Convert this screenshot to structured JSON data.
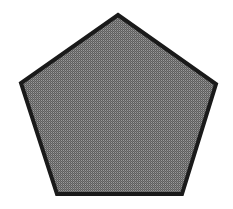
{
  "figure": {
    "shape": "regular-pentagon",
    "fill_color": "#7a7a7a",
    "fill_pattern_dark": "#5e5e5e",
    "fill_pattern_light": "#9a9a9a",
    "stroke_color": "#1a1a1a",
    "stroke_width": 4,
    "vertices": [
      [
        118,
        15
      ],
      [
        216,
        84
      ],
      [
        182,
        194
      ],
      [
        57,
        194
      ],
      [
        21,
        83
      ]
    ]
  }
}
